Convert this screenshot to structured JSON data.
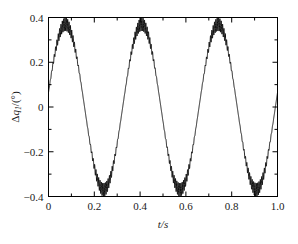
{
  "chart_data": {
    "type": "line",
    "title": "",
    "subtitle": "",
    "xlabel": "t/s",
    "ylabel": "Δq₁/(°)",
    "ylabel_parts": {
      "delta": "Δ",
      "symbol": "q",
      "subscript": "1",
      "slash": "/(",
      "unit": "°",
      "close": ")"
    },
    "xlim": [
      0,
      1.0
    ],
    "ylim": [
      -0.4,
      0.4
    ],
    "xticks": [
      0,
      0.2,
      0.4,
      0.6,
      0.8,
      1.0
    ],
    "xtick_labels": [
      "0",
      "0.2",
      "0.4",
      "0.6",
      "0.8",
      "1.0"
    ],
    "yticks": [
      -0.4,
      -0.2,
      0,
      0.2,
      0.4
    ],
    "ytick_labels": [
      "−0.4",
      "−0.2",
      "0",
      "0.2",
      "0.4"
    ],
    "x_minor_step": 0.1,
    "y_minor_step": 0.1,
    "grid": false,
    "legend": null,
    "line_color": "#000000",
    "frame_color": "#000000",
    "series": [
      {
        "name": "Δq₁",
        "description": "3 Hz sinusoid with superimposed high-frequency ripple whose envelope is largest at the extrema",
        "carrier_amplitude_deg": 0.37,
        "carrier_frequency_hz": 3.0,
        "carrier_phase_deg": 10,
        "ripple_frequency_hz": 170,
        "ripple_amplitude_deg": 0.03,
        "peaks_t": [
          0.09,
          0.42,
          0.75
        ],
        "peaks_value": [
          0.38,
          0.38,
          0.38
        ],
        "troughs_t": [
          0.25,
          0.585,
          0.92
        ],
        "troughs_value": [
          -0.38,
          -0.38,
          -0.38
        ],
        "start_value": 0.03,
        "end_value": -0.05
      }
    ]
  }
}
